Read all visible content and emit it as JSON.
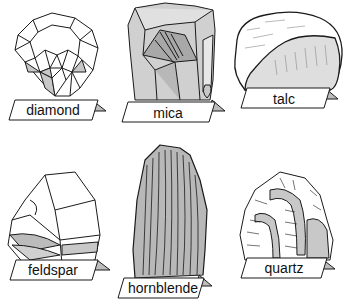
{
  "diagram": {
    "type": "labeled mineral specimens",
    "minerals": [
      {
        "name": "diamond",
        "row": 1,
        "col": 1
      },
      {
        "name": "mica",
        "row": 1,
        "col": 2
      },
      {
        "name": "talc",
        "row": 1,
        "col": 3
      },
      {
        "name": "feldspar",
        "row": 2,
        "col": 1
      },
      {
        "name": "hornblende",
        "row": 2,
        "col": 2
      },
      {
        "name": "quartz",
        "row": 2,
        "col": 3
      }
    ],
    "colors": {
      "outline": "#1a1a1a",
      "fill_light": "#ffffff",
      "fill_gray": "#c8c8c8",
      "fill_mid": "#b0b0b0",
      "label_tab_shadow": "#bdbdbd"
    }
  }
}
